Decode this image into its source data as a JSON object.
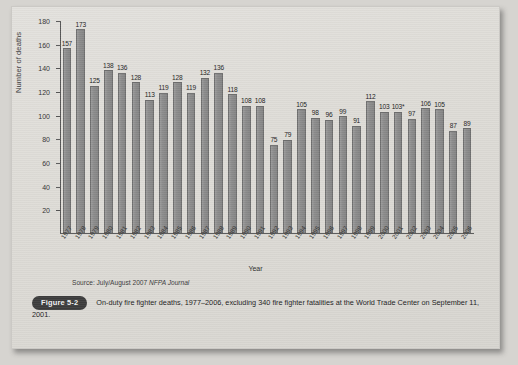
{
  "chart_data": {
    "type": "bar",
    "title": "",
    "xlabel": "Year",
    "ylabel": "Number of deaths",
    "ylim": [
      0,
      180
    ],
    "ytick_step": 20,
    "yticks": [
      0,
      20,
      40,
      60,
      80,
      100,
      120,
      140,
      160,
      180
    ],
    "grid": false,
    "legend": null,
    "bar_color": "#8c8c8c",
    "categories": [
      "1977",
      "1978",
      "1979",
      "1980",
      "1981",
      "1982",
      "1983",
      "1984",
      "1985",
      "1986",
      "1987",
      "1988",
      "1989",
      "1990",
      "1991",
      "1992",
      "1993",
      "1994",
      "1995",
      "1996",
      "1997",
      "1998",
      "1999",
      "2000",
      "2001",
      "2002",
      "2003",
      "2004",
      "2005",
      "2006"
    ],
    "values": [
      157,
      173,
      125,
      138,
      136,
      128,
      113,
      119,
      128,
      119,
      132,
      136,
      118,
      108,
      108,
      75,
      79,
      105,
      98,
      96,
      99,
      91,
      112,
      103,
      103,
      97,
      106,
      105,
      87,
      89
    ],
    "value_labels": [
      "157",
      "173",
      "125",
      "138",
      "136",
      "128",
      "113",
      "119",
      "128",
      "119",
      "132",
      "136",
      "118",
      "108",
      "108",
      "75",
      "79",
      "105",
      "98",
      "96",
      "99",
      "91",
      "112",
      "103",
      "103*",
      "97",
      "106",
      "105",
      "87",
      "89"
    ],
    "annotations": [
      "103* excludes 340 fire fighter fatalities at the World Trade Center on September 11, 2001"
    ]
  },
  "source": {
    "prefix": "Source: July/August 2007 ",
    "italic": "NFPA Journal"
  },
  "caption": {
    "figure_label": "Figure 5-2",
    "text": "On-duty fire fighter deaths, 1977–2006, excluding 340 fire fighter fatalities at the World Trade Center on September 11, 2001."
  }
}
